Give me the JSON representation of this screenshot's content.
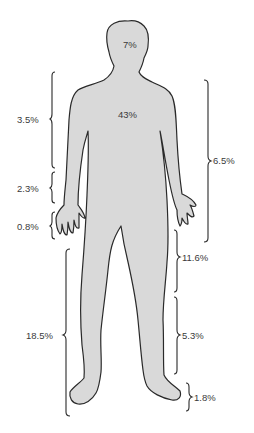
{
  "figure": {
    "type": "body-surface-area-diagram",
    "colors": {
      "body_fill": "#d9d9d9",
      "outline": "#2a2a2a",
      "text": "#3a3a3a",
      "background": "#ffffff"
    },
    "labels": {
      "head": "7%",
      "trunk": "43%",
      "upper_arm": "3.5%",
      "forearm": "2.3%",
      "hand": "0.8%",
      "whole_leg": "18.5%",
      "whole_arm": "6.5%",
      "thigh": "11.6%",
      "lower_leg": "5.3%",
      "foot": "1.8%"
    }
  }
}
